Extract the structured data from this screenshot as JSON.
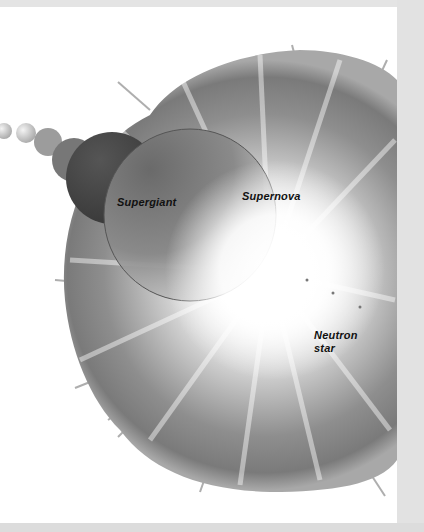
{
  "illustration": {
    "subject": "Stellar evolution: supergiant to supernova to neutron star",
    "labels": {
      "supergiant": "Supergiant",
      "supernova": "Supernova",
      "neutron_star_line1": "Neutron",
      "neutron_star_line2": "star"
    },
    "colors": {
      "background": "#ffffff",
      "frame": "#dedede",
      "nebula_dark": "#6e6e6e",
      "nebula_mid": "#9a9a9a",
      "core_glow": "#ffffff",
      "star_dark": "#4a4a4a",
      "label_text": "#111111"
    }
  }
}
